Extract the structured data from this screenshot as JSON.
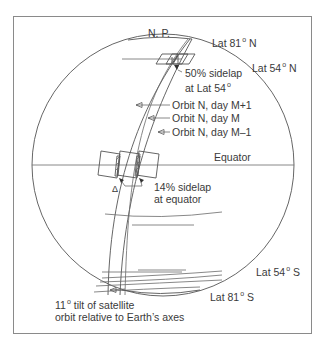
{
  "diagram": {
    "labels": {
      "north_pole": "N. P.",
      "lat81n": "Lat 81",
      "lat81n_suffix": "N",
      "lat54n": "Lat 54",
      "lat54n_suffix": "N",
      "sidelap50_line1": "50% sidelap",
      "sidelap50_line2": "at Lat 54",
      "orbit_m_plus_1": "Orbit N, day M+1",
      "orbit_m": "Orbit N, day M",
      "orbit_m_minus_1": "Orbit N, day M–1",
      "equator": "Equator",
      "delta": "Δ",
      "sidelap14_line1": "14% sidelap",
      "sidelap14_line2": "at equator",
      "lat54s": "Lat 54",
      "lat54s_suffix": "S",
      "lat81s": "Lat 81",
      "lat81s_suffix": "S",
      "tilt_value": "11",
      "tilt_line1": "tilt of satellite",
      "tilt_line2": "orbit relative to Earth’s axes"
    },
    "degree_symbol": "o",
    "colors": {
      "line": "#555555",
      "frame": "#8a8a8a",
      "text": "#3a3a3a",
      "background": "#ffffff"
    }
  }
}
